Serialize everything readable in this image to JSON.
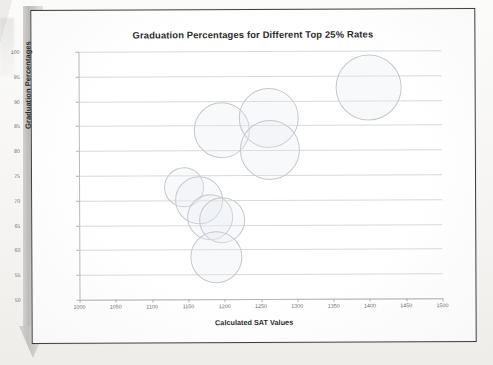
{
  "document": {
    "type": "scanned-page",
    "arrow_graphic": "gray-down-arrow-bookmark"
  },
  "chart_data": {
    "type": "scatter",
    "title": "Graduation Percentages for Different Top 25% Rates",
    "xlabel": "Calculated SAT Values",
    "ylabel": "Graduation Percentages",
    "xlim": [
      1000,
      1500
    ],
    "ylim": [
      50,
      100
    ],
    "xticks": [
      1000,
      1050,
      1100,
      1150,
      1200,
      1250,
      1300,
      1350,
      1400,
      1450,
      1500
    ],
    "yticks": [
      50,
      55,
      60,
      65,
      70,
      75,
      80,
      85,
      90,
      95,
      100
    ],
    "grid": "horizontal",
    "legend": "none",
    "marker": "open-circle-bubble",
    "points": [
      {
        "x": 1145,
        "y": 72.5,
        "r": 20
      },
      {
        "x": 1165,
        "y": 70.0,
        "r": 24
      },
      {
        "x": 1180,
        "y": 66.5,
        "r": 23
      },
      {
        "x": 1197,
        "y": 66.0,
        "r": 23
      },
      {
        "x": 1188,
        "y": 58.5,
        "r": 26
      },
      {
        "x": 1197,
        "y": 84.0,
        "r": 28
      },
      {
        "x": 1262,
        "y": 86.5,
        "r": 30
      },
      {
        "x": 1263,
        "y": 80.0,
        "r": 30
      },
      {
        "x": 1400,
        "y": 92.5,
        "r": 33
      }
    ]
  }
}
